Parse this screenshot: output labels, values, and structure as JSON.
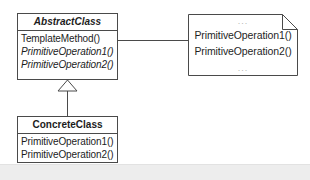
{
  "diagram": {
    "colors": {
      "stroke": "#4a4a4a",
      "text": "#1c1c1c",
      "ellipsis": "#b4b4b4",
      "background": "#ffffff",
      "page_band": "#ededed"
    },
    "abstract_class": {
      "name": "AbstractClass",
      "members": [
        {
          "label": "TemplateMethod()",
          "abstract": false
        },
        {
          "label": "PrimitiveOperation1()",
          "abstract": true
        },
        {
          "label": "PrimitiveOperation2()",
          "abstract": true
        }
      ]
    },
    "concrete_class": {
      "name": "ConcreteClass",
      "members": [
        {
          "label": "PrimitiveOperation1()",
          "abstract": false
        },
        {
          "label": "PrimitiveOperation2()",
          "abstract": false
        }
      ]
    },
    "note": {
      "top_ellipsis": "...",
      "lines": [
        "PrimitiveOperation1()",
        "PrimitiveOperation2()"
      ],
      "bottom_ellipsis": "..."
    },
    "relationships": [
      {
        "kind": "generalization",
        "from": "ConcreteClass",
        "to": "AbstractClass"
      },
      {
        "kind": "note-anchor",
        "from": "AbstractClass",
        "to": "note"
      }
    ]
  }
}
